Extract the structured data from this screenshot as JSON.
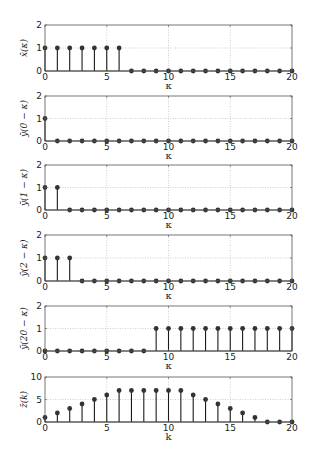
{
  "chart_data": [
    {
      "type": "stem",
      "ylabel": "x̄(κ)",
      "xlabel": "κ",
      "xlim": [
        0,
        20
      ],
      "ylim": [
        0,
        2
      ],
      "yticks": [
        0,
        1,
        2
      ],
      "xticks": [
        0,
        5,
        10,
        15,
        20
      ],
      "grid": true,
      "x": [
        0,
        1,
        2,
        3,
        4,
        5,
        6,
        7,
        8,
        9,
        10,
        11,
        12,
        13,
        14,
        15,
        16,
        17,
        18,
        19,
        20
      ],
      "values": [
        1,
        1,
        1,
        1,
        1,
        1,
        1,
        0,
        0,
        0,
        0,
        0,
        0,
        0,
        0,
        0,
        0,
        0,
        0,
        0,
        0
      ]
    },
    {
      "type": "stem",
      "ylabel": "ȳ(0 − κ)",
      "xlabel": "κ",
      "xlim": [
        0,
        20
      ],
      "ylim": [
        0,
        2
      ],
      "yticks": [
        0,
        1,
        2
      ],
      "xticks": [
        0,
        5,
        10,
        15,
        20
      ],
      "grid": true,
      "x": [
        0,
        1,
        2,
        3,
        4,
        5,
        6,
        7,
        8,
        9,
        10,
        11,
        12,
        13,
        14,
        15,
        16,
        17,
        18,
        19,
        20
      ],
      "values": [
        1,
        0,
        0,
        0,
        0,
        0,
        0,
        0,
        0,
        0,
        0,
        0,
        0,
        0,
        0,
        0,
        0,
        0,
        0,
        0,
        0
      ]
    },
    {
      "type": "stem",
      "ylabel": "ȳ(1 − κ)",
      "xlabel": "κ",
      "xlim": [
        0,
        20
      ],
      "ylim": [
        0,
        2
      ],
      "yticks": [
        0,
        1,
        2
      ],
      "xticks": [
        0,
        5,
        10,
        15,
        20
      ],
      "grid": true,
      "x": [
        0,
        1,
        2,
        3,
        4,
        5,
        6,
        7,
        8,
        9,
        10,
        11,
        12,
        13,
        14,
        15,
        16,
        17,
        18,
        19,
        20
      ],
      "values": [
        1,
        1,
        0,
        0,
        0,
        0,
        0,
        0,
        0,
        0,
        0,
        0,
        0,
        0,
        0,
        0,
        0,
        0,
        0,
        0,
        0
      ]
    },
    {
      "type": "stem",
      "ylabel": "ȳ(2 − κ)",
      "xlabel": "κ",
      "xlim": [
        0,
        20
      ],
      "ylim": [
        0,
        2
      ],
      "yticks": [
        0,
        1,
        2
      ],
      "xticks": [
        0,
        5,
        10,
        15,
        20
      ],
      "grid": true,
      "x": [
        0,
        1,
        2,
        3,
        4,
        5,
        6,
        7,
        8,
        9,
        10,
        11,
        12,
        13,
        14,
        15,
        16,
        17,
        18,
        19,
        20
      ],
      "values": [
        1,
        1,
        1,
        0,
        0,
        0,
        0,
        0,
        0,
        0,
        0,
        0,
        0,
        0,
        0,
        0,
        0,
        0,
        0,
        0,
        0
      ]
    },
    {
      "type": "stem",
      "ylabel": "ȳ(20 − κ)",
      "xlabel": "κ",
      "xlim": [
        0,
        20
      ],
      "ylim": [
        0,
        2
      ],
      "yticks": [
        0,
        1,
        2
      ],
      "xticks": [
        0,
        5,
        10,
        15,
        20
      ],
      "grid": true,
      "x": [
        0,
        1,
        2,
        3,
        4,
        5,
        6,
        7,
        8,
        9,
        10,
        11,
        12,
        13,
        14,
        15,
        16,
        17,
        18,
        19,
        20
      ],
      "values": [
        0,
        0,
        0,
        0,
        0,
        0,
        0,
        0,
        0,
        1,
        1,
        1,
        1,
        1,
        1,
        1,
        1,
        1,
        1,
        1,
        1
      ]
    },
    {
      "type": "stem",
      "ylabel": "z̄(k)",
      "xlabel": "k",
      "xlim": [
        0,
        20
      ],
      "ylim": [
        0,
        10
      ],
      "yticks": [
        0,
        5,
        10
      ],
      "xticks": [
        0,
        5,
        10,
        15,
        20
      ],
      "grid": true,
      "x": [
        0,
        1,
        2,
        3,
        4,
        5,
        6,
        7,
        8,
        9,
        10,
        11,
        12,
        13,
        14,
        15,
        16,
        17,
        18,
        19,
        20
      ],
      "values": [
        1,
        2,
        3,
        4,
        5,
        6,
        7,
        7,
        7,
        7,
        7,
        7,
        6,
        5,
        4,
        3,
        2,
        1,
        0,
        0,
        0
      ]
    }
  ],
  "layout": {
    "axes_left": 45,
    "axes_right": 292,
    "axes": [
      {
        "top": 25,
        "bottom": 71
      },
      {
        "top": 96,
        "bottom": 141
      },
      {
        "top": 165,
        "bottom": 210
      },
      {
        "top": 235,
        "bottom": 281
      },
      {
        "top": 306,
        "bottom": 351
      },
      {
        "top": 377,
        "bottom": 422
      }
    ],
    "stem_color": "#1a1a1a",
    "marker_color": "#333333",
    "grid_color": "#b0b0b0"
  }
}
